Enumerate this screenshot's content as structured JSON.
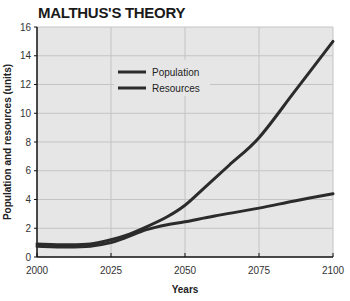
{
  "chart_data": {
    "type": "line",
    "title": "MALTHUS'S THEORY",
    "xlabel": "Years",
    "ylabel": "Population and resources (units)",
    "xlim": [
      2000,
      2100
    ],
    "ylim": [
      0,
      16
    ],
    "xticks": [
      2000,
      2025,
      2050,
      2075,
      2100
    ],
    "yticks": [
      0,
      2,
      4,
      6,
      8,
      10,
      12,
      14,
      16
    ],
    "grid": true,
    "legend_position": "upper-left-center",
    "series": [
      {
        "name": "Population",
        "color": "#2b2b2b",
        "x": [
          2000,
          2010,
          2018,
          2025,
          2030,
          2037,
          2044,
          2050,
          2057,
          2065,
          2075,
          2087,
          2100
        ],
        "y": [
          0.9,
          0.85,
          0.9,
          1.2,
          1.5,
          2.1,
          2.8,
          3.6,
          4.9,
          6.4,
          8.3,
          11.5,
          15.0
        ]
      },
      {
        "name": "Resources",
        "color": "#2b2b2b",
        "x": [
          2000,
          2010,
          2018,
          2025,
          2030,
          2037,
          2044,
          2050,
          2060,
          2075,
          2087,
          2100
        ],
        "y": [
          0.75,
          0.7,
          0.75,
          1.0,
          1.35,
          1.9,
          2.25,
          2.45,
          2.85,
          3.4,
          3.9,
          4.4
        ]
      }
    ]
  },
  "style": {
    "plot_background": "#e6e6e6",
    "grid_color": "#c4c4c4",
    "axis_color": "#111111"
  }
}
